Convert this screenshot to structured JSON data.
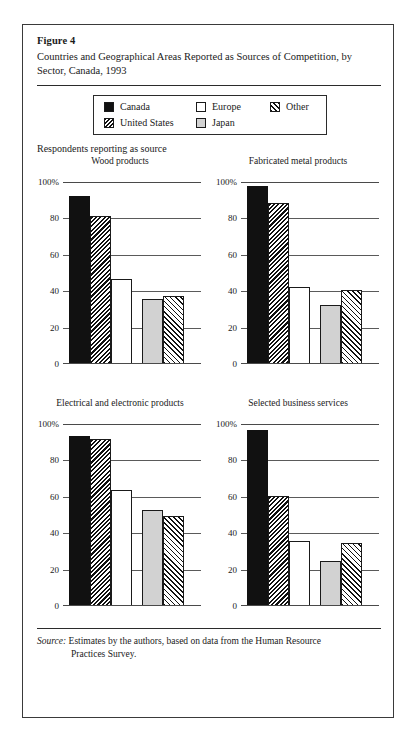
{
  "figure": {
    "label": "Figure 4",
    "title": "Countries and Geographical Areas Reported as Sources of Competition, by Sector, Canada, 1993",
    "section_label": "Respondents reporting as source",
    "source_prefix": "Source:",
    "source_text": "Estimates by the authors, based on data from the Human Resource",
    "source_text_cont": "Practices Survey."
  },
  "legend": {
    "items": [
      {
        "label": "Canada",
        "swatch": "solid-black-swatch"
      },
      {
        "label": "Europe",
        "swatch": "white-swatch"
      },
      {
        "label": "Other",
        "swatch": "light-diagonal-hatch-swatch"
      },
      {
        "label": "United States",
        "swatch": "dense-diagonal-hatch-swatch"
      },
      {
        "label": "Japan",
        "swatch": "gray-swatch"
      }
    ]
  },
  "axis": {
    "ticks": [
      "100%",
      "80",
      "60",
      "40",
      "20",
      "0"
    ],
    "tick_values": [
      100,
      80,
      60,
      40,
      20,
      0
    ]
  },
  "chart_data": {
    "type": "bar",
    "title": "Countries and Geographical Areas Reported as Sources of Competition, by Sector, Canada, 1993",
    "subtitle": "Respondents reporting as source",
    "xlabel": "",
    "ylabel": "Respondents reporting as source (%)",
    "ylim": [
      0,
      100
    ],
    "yticks": [
      0,
      20,
      40,
      60,
      80,
      100
    ],
    "grid": true,
    "legend_position": "top-center",
    "categories": [
      "Canada",
      "United States",
      "Europe",
      "Japan",
      "Other"
    ],
    "panels": [
      {
        "title": "Wood products",
        "values": [
          92,
          81,
          46,
          35,
          37
        ]
      },
      {
        "title": "Fabricated metal products",
        "values": [
          97,
          88,
          42,
          32,
          40
        ]
      },
      {
        "title": "Electrical and electronic products",
        "values": [
          93,
          91,
          63,
          52,
          49
        ]
      },
      {
        "title": "Selected business services",
        "values": [
          96,
          60,
          35,
          24,
          34
        ]
      }
    ]
  }
}
